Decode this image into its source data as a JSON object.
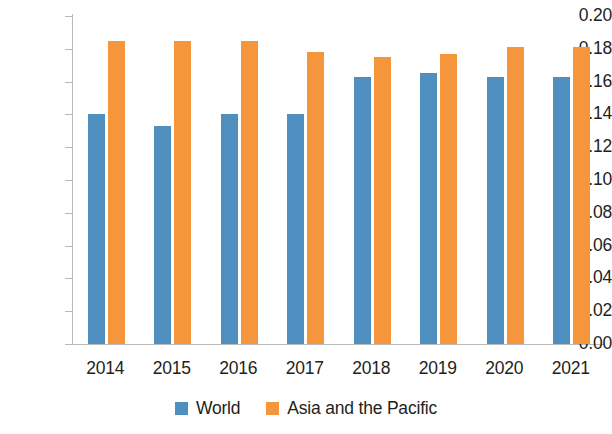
{
  "chart_data": {
    "type": "bar",
    "title": "",
    "subtitle": "",
    "xlabel": "",
    "ylabel": "",
    "categories": [
      "2014",
      "2015",
      "2016",
      "2017",
      "2018",
      "2019",
      "2020",
      "2021"
    ],
    "series": [
      {
        "name": "World",
        "color": "#4e8fc0",
        "values": [
          0.14,
          0.133,
          0.14,
          0.14,
          0.163,
          0.165,
          0.163,
          0.163
        ]
      },
      {
        "name": "Asia and the Pacific",
        "color": "#f5963c",
        "values": [
          0.185,
          0.185,
          0.185,
          0.178,
          0.175,
          0.177,
          0.181,
          0.181
        ]
      }
    ],
    "ylim": [
      0.0,
      0.2
    ],
    "ytick_step": 0.02,
    "ytick_labels": [
      "0.20",
      "0.18",
      "0.16",
      "0.14",
      "0.12",
      "0.10",
      "0.08",
      "0.06",
      "0.04",
      "0.02",
      "0.00"
    ],
    "ytick_values": [
      0.2,
      0.18,
      0.16,
      0.14,
      0.12,
      0.1,
      0.08,
      0.06,
      0.04,
      0.02,
      0.0
    ],
    "grid": false,
    "legend_position": "bottom",
    "legend": [
      {
        "label": "World",
        "color": "#4e8fc0"
      },
      {
        "label": "Asia and the Pacific",
        "color": "#f5963c"
      }
    ]
  }
}
